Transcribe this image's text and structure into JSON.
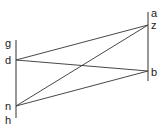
{
  "diagram": {
    "labels": {
      "g": "g",
      "d": "d",
      "n": "n",
      "h": "h",
      "a": "a",
      "z": "z",
      "b": "b"
    },
    "segments": [
      {
        "from": "d",
        "to": "z"
      },
      {
        "from": "d",
        "to": "b"
      },
      {
        "from": "n",
        "to": "z"
      },
      {
        "from": "n",
        "to": "b"
      }
    ],
    "colors": {
      "line": "#333333",
      "text": "#222222"
    }
  }
}
